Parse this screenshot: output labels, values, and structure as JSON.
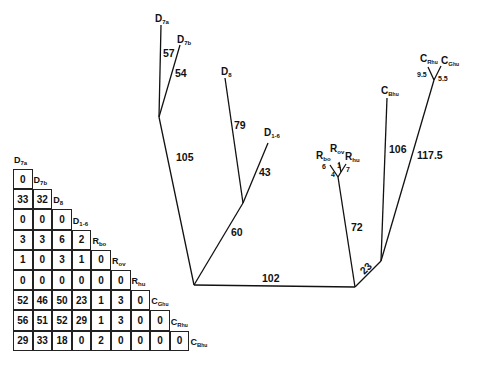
{
  "tree": {
    "taxa": [
      {
        "id": "D7a",
        "base": "D",
        "sub": "7a"
      },
      {
        "id": "D7b",
        "base": "D",
        "sub": "7b"
      },
      {
        "id": "D8",
        "base": "D",
        "sub": "8"
      },
      {
        "id": "D1-6",
        "base": "D",
        "sub": "1-6"
      },
      {
        "id": "Rbo",
        "base": "R",
        "sub": "bo"
      },
      {
        "id": "Rov",
        "base": "R",
        "sub": "ov"
      },
      {
        "id": "Rhu",
        "base": "R",
        "sub": "hu"
      },
      {
        "id": "CBhu",
        "base": "C",
        "sub": "B",
        "sub2": "hu"
      },
      {
        "id": "CRhu",
        "base": "C",
        "sub": "R",
        "sub2": "hu"
      },
      {
        "id": "CGhu",
        "base": "C",
        "sub": "G",
        "sub2": "hu"
      }
    ],
    "branch_lengths": {
      "D7a": "57",
      "D7b": "54",
      "D7_stem": "105",
      "D8": "79",
      "D1-6": "43",
      "D8_D1-6_stem": "60",
      "root": "102",
      "R_stem": "72",
      "Rbo": "6",
      "Rov": "1",
      "Rhu": "7",
      "R_inner": "4",
      "C_stem": "23",
      "CBhu": "106",
      "CRhu_CGhu_stem": "117.5",
      "CRhu": "9.5",
      "CGhu": "5.5"
    }
  },
  "matrix": {
    "headers": [
      {
        "base": "D",
        "sub": "7a"
      },
      {
        "base": "D",
        "sub": "7b"
      },
      {
        "base": "D",
        "sub": "8"
      },
      {
        "base": "D",
        "sub": "1-6"
      },
      {
        "base": "R",
        "sub": "bo"
      },
      {
        "base": "R",
        "sub": "ov"
      },
      {
        "base": "R",
        "sub": "hu"
      },
      {
        "base": "C",
        "sub": "G",
        "sub2": "hu"
      },
      {
        "base": "C",
        "sub": "R",
        "sub2": "hu"
      },
      {
        "base": "C",
        "sub": "B",
        "sub2": "hu"
      }
    ],
    "rows": [
      [
        "0"
      ],
      [
        "33",
        "32"
      ],
      [
        "0",
        "0",
        "0"
      ],
      [
        "3",
        "3",
        "6",
        "2"
      ],
      [
        "1",
        "0",
        "3",
        "1",
        "0"
      ],
      [
        "0",
        "0",
        "0",
        "0",
        "0",
        "0"
      ],
      [
        "52",
        "46",
        "50",
        "23",
        "1",
        "3",
        "0"
      ],
      [
        "56",
        "51",
        "52",
        "29",
        "1",
        "3",
        "0",
        "0"
      ],
      [
        "29",
        "33",
        "18",
        "0",
        "2",
        "0",
        "0",
        "0",
        "0"
      ]
    ]
  }
}
